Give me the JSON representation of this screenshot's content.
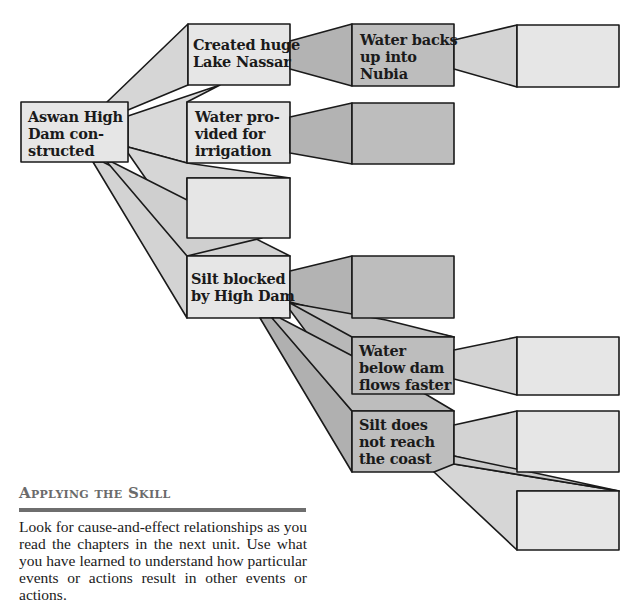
{
  "diagram": {
    "type": "cause-and-effect flow",
    "colors": {
      "light_fill": "#e6e6e6",
      "light_connector": "#d6d6d6",
      "dark_fill": "#bdbdbd",
      "dark_connector": "#b0b0b0",
      "stroke": "#1a1a1a"
    },
    "nodes": {
      "root": {
        "label": "Aswan High\nDam con-\nstructed"
      },
      "lake": {
        "label": "Created huge\nLake Nassar"
      },
      "irrigation": {
        "label": "Water pro-\nvided for\nirrigation"
      },
      "empty_level1": {
        "label": ""
      },
      "silt": {
        "label": "Silt blocked\nby High Dam"
      },
      "nubia": {
        "label": "Water backs\nup into\nNubia"
      },
      "empty_irrigation_effect": {
        "label": ""
      },
      "empty_silt_effect": {
        "label": ""
      },
      "faster": {
        "label": "Water\nbelow dam\nflows faster"
      },
      "coast": {
        "label": "Silt does\nnot reach\nthe coast"
      },
      "empty_nubia_effect": {
        "label": ""
      },
      "empty_faster_effect": {
        "label": ""
      },
      "empty_coast_effect": {
        "label": ""
      },
      "empty_coast_effect_2": {
        "label": ""
      }
    }
  },
  "skill_section": {
    "heading": "Applying the Skill",
    "body": "Look for cause-and-effect relationships as you read the chapters in the next unit. Use what you have learned to understand how particular events or actions result in other events or actions."
  }
}
